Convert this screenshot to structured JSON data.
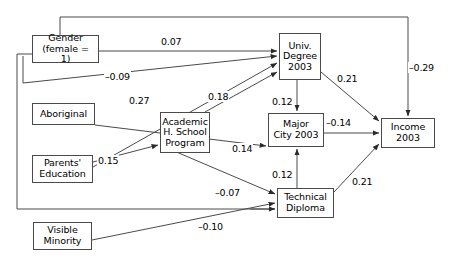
{
  "diagram": {
    "type": "path-diagram",
    "title": "",
    "nodes": [
      {
        "id": "gender",
        "label": "Gender\n(female = 1)",
        "line1": "Gender",
        "line2": "(female = 1)",
        "x": 32,
        "y": 35,
        "w": 67,
        "h": 28
      },
      {
        "id": "aboriginal",
        "label": "Aboriginal",
        "line1": "Aboriginal",
        "line2": "",
        "x": 32,
        "y": 103,
        "w": 63,
        "h": 22
      },
      {
        "id": "parents",
        "label": "Parents'\nEducation",
        "line1": "Parents'",
        "line2": "Education",
        "x": 32,
        "y": 155,
        "w": 61,
        "h": 28
      },
      {
        "id": "visible",
        "label": "Visible\nMinority",
        "line1": "Visible",
        "line2": "Minority",
        "x": 33,
        "y": 222,
        "w": 59,
        "h": 28
      },
      {
        "id": "academic",
        "label": "Academic\nH. School\nProgram",
        "line1": "Academic",
        "line2": "H. School",
        "line3": "Program",
        "x": 160,
        "y": 112,
        "w": 50,
        "h": 41
      },
      {
        "id": "univ",
        "label": "Univ.\nDegree\n2003",
        "line1": "Univ.",
        "line2": "Degree",
        "line3": "2003",
        "x": 279,
        "y": 33,
        "w": 42,
        "h": 47
      },
      {
        "id": "majorcity",
        "label": "Major\nCity 2003",
        "line1": "Major",
        "line2": "City 2003",
        "x": 268,
        "y": 113,
        "w": 56,
        "h": 34
      },
      {
        "id": "technical",
        "label": "Technical\nDiploma",
        "line1": "Technical",
        "line2": "Diploma",
        "x": 277,
        "y": 188,
        "w": 57,
        "h": 30
      },
      {
        "id": "income",
        "label": "Income\n2003",
        "line1": "Income",
        "line2": "2003",
        "x": 381,
        "y": 118,
        "w": 54,
        "h": 30
      }
    ],
    "edges": [
      {
        "id": "gender-univ",
        "from": "gender",
        "to": "univ",
        "coefficient": "0.07",
        "label_x": 160,
        "label_y": 36
      },
      {
        "id": "gender-income",
        "from": "gender",
        "to": "income",
        "coefficient": "–0.29",
        "label_x": 408,
        "label_y": 62
      },
      {
        "id": "aboriginal-univ",
        "from": "aboriginal",
        "to": "univ",
        "coefficient": "–0.09",
        "label_x": 104,
        "label_y": 71
      },
      {
        "id": "parents-univ",
        "from": "parents",
        "to": "univ",
        "coefficient": "0.27",
        "label_x": 128,
        "label_y": 95
      },
      {
        "id": "academic-univ",
        "from": "academic",
        "to": "univ",
        "coefficient": "0.18",
        "label_x": 207,
        "label_y": 91
      },
      {
        "id": "parents-academic",
        "from": "parents",
        "to": "academic",
        "coefficient": "0.15",
        "label_x": 97,
        "label_y": 155
      },
      {
        "id": "univ-majorcity",
        "from": "univ",
        "to": "majorcity",
        "coefficient": "0.12",
        "label_x": 271,
        "label_y": 96
      },
      {
        "id": "univ-income",
        "from": "univ",
        "to": "income",
        "coefficient": "0.21",
        "label_x": 336,
        "label_y": 73
      },
      {
        "id": "majorcity-income",
        "from": "majorcity",
        "to": "income",
        "coefficient": "–0.14",
        "label_x": 325,
        "label_y": 117
      },
      {
        "id": "technical-majorcity",
        "from": "technical",
        "to": "majorcity",
        "coefficient": "0.12",
        "label_x": 271,
        "label_y": 169
      },
      {
        "id": "technical-income",
        "from": "technical",
        "to": "income",
        "coefficient": "0.21",
        "label_x": 351,
        "label_y": 176
      },
      {
        "id": "aboriginal-majorcity",
        "from": "aboriginal",
        "to": "majorcity",
        "coefficient": "0.14",
        "label_x": 231,
        "label_y": 143
      },
      {
        "id": "academic-technical",
        "from": "academic",
        "to": "technical",
        "coefficient": "–0.07",
        "label_x": 214,
        "label_y": 187
      },
      {
        "id": "visible-technical",
        "from": "visible",
        "to": "technical",
        "coefficient": "–0.10",
        "label_x": 197,
        "label_y": 221
      }
    ]
  }
}
